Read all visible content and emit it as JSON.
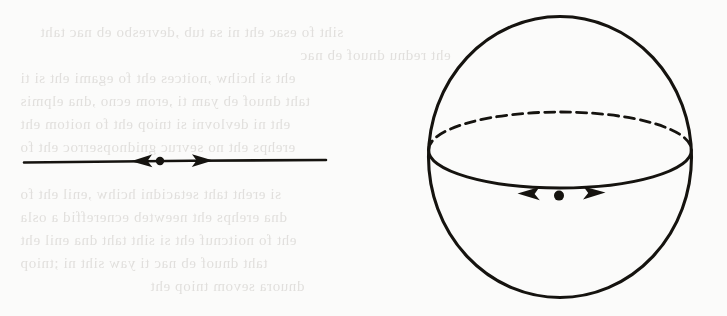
{
  "page": {
    "kind": "scanned-book-figure",
    "background_color": "#fbfbfa",
    "ink_color": "#15130f",
    "bleed_text_color": "#dddbd8",
    "width": 727,
    "height": 316
  },
  "bleed_through": {
    "description": "Faint mirrored show-through text from the reverse side of the scanned page; illegible.",
    "lines": [
      {
        "x": 40,
        "y": 24,
        "text": "siht fo esac eht ni sa tub ,devresbo eb nac taht"
      },
      {
        "x": 300,
        "y": 47,
        "text": "eht rednu dnuof eb nac"
      },
      {
        "x": 20,
        "y": 70,
        "text": "eht si hcihw ,noitces eht fo egami eht si ti"
      },
      {
        "x": 20,
        "y": 93,
        "text": "taht dnuof eb yam ti ,erom ecno ,dna elpmis"
      },
      {
        "x": 20,
        "y": 116,
        "text": "eht ni devlovni si tniop eht fo noitom eht"
      },
      {
        "x": 20,
        "y": 139,
        "text": "erehps eht no sevruc gnidnopserroc eht fo"
      },
      {
        "x": 20,
        "y": 186,
        "text": "si ereht taht setacidni hcihw ,enil eht fo"
      },
      {
        "x": 20,
        "y": 209,
        "text": "dna erehps eht neewteb ecnereffid a osla"
      },
      {
        "x": 20,
        "y": 232,
        "text": "eht fo noitcnuf eht si siht taht dna enil eht"
      },
      {
        "x": 20,
        "y": 255,
        "text": "taht dnuof eb nac ti yaw siht ni ;tniop"
      },
      {
        "x": 150,
        "y": 278,
        "text": "dnuora sevom tniop eht"
      }
    ]
  },
  "figures": [
    {
      "id": "line-figure",
      "label": "directed line with marked point",
      "elements": {
        "line": {
          "x1": 24,
          "y1": 162,
          "x2": 326,
          "y2": 160
        },
        "point": {
          "cx": 160,
          "cy": 161,
          "r": 4
        },
        "arrow_left": {
          "tip_x": 131,
          "tip_y": 161,
          "direction": "left"
        },
        "arrow_right": {
          "tip_x": 213,
          "tip_y": 161,
          "direction": "right"
        }
      }
    },
    {
      "id": "sphere-figure",
      "label": "sphere with equator and directed point on equator",
      "elements": {
        "outline": {
          "cx": 560,
          "cy": 157,
          "rx": 132,
          "ry": 141
        },
        "equator": {
          "cx": 560,
          "cy": 150,
          "rx": 132,
          "ry": 38,
          "front_style": "solid",
          "back_style": "dashed"
        },
        "point": {
          "cx": 559,
          "cy": 196,
          "r": 5
        },
        "arrow_left": {
          "tip_x": 518,
          "tip_y": 194,
          "direction": "left"
        },
        "arrow_right": {
          "tip_x": 605,
          "tip_y": 193,
          "direction": "right"
        }
      }
    }
  ]
}
